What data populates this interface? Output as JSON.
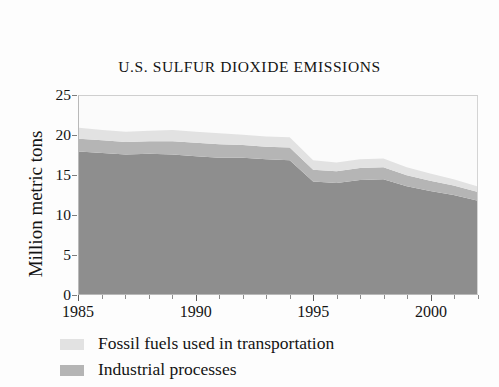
{
  "figure": {
    "title": "U.S. SULFUR DIOXIDE EMISSIONS"
  },
  "colors": {
    "band_electric": "#8e8e8e",
    "band_industrial": "#b5b5b5",
    "band_transport": "#e2e2e2",
    "plot_background": "#fbfbfb",
    "frame": "#b9b9b9",
    "text": "#141414"
  },
  "legend": {
    "position": "below-axis",
    "items": [
      {
        "label": "Fossil fuels used in transportation",
        "color": "#e2e2e2",
        "swatch": "light-gray-swatch"
      },
      {
        "label": "Industrial processes",
        "color": "#b5b5b5",
        "swatch": "medium-gray-swatch"
      }
    ]
  },
  "chart_data": {
    "type": "area",
    "stacked": true,
    "title": "U.S. SULFUR DIOXIDE EMISSIONS",
    "xlabel": "",
    "ylabel": "Million metric tons",
    "xlim": [
      1985,
      2002
    ],
    "ylim": [
      0,
      25
    ],
    "yticks": [
      0,
      5,
      10,
      15,
      20,
      25
    ],
    "ytick_labels": [
      "0",
      "5",
      "10",
      "15",
      "20",
      "25"
    ],
    "xticks": [
      1985,
      1990,
      1995,
      2000
    ],
    "xtick_labels": [
      "1985",
      "1990",
      "1995",
      "2000"
    ],
    "x_minor_ticks": [
      1986,
      1987,
      1988,
      1989,
      1991,
      1992,
      1993,
      1994,
      1996,
      1997,
      1998,
      1999,
      2001,
      2002
    ],
    "grid": false,
    "legend_position": "below",
    "x": [
      1985,
      1986,
      1987,
      1988,
      1989,
      1990,
      1991,
      1992,
      1993,
      1994,
      1995,
      1996,
      1997,
      1998,
      1999,
      2000,
      2001,
      2002
    ],
    "series": [
      {
        "name": "Electric utilities and other",
        "color": "#8e8e8e",
        "values": [
          18.0,
          17.8,
          17.6,
          17.7,
          17.6,
          17.4,
          17.2,
          17.2,
          17.0,
          16.9,
          14.2,
          14.0,
          14.4,
          14.5,
          13.6,
          13.0,
          12.5,
          11.8
        ]
      },
      {
        "name": "Industrial processes",
        "color": "#b5b5b5",
        "values": [
          1.6,
          1.6,
          1.6,
          1.6,
          1.7,
          1.7,
          1.7,
          1.6,
          1.6,
          1.6,
          1.5,
          1.5,
          1.5,
          1.5,
          1.4,
          1.3,
          1.2,
          1.1
        ]
      },
      {
        "name": "Fossil fuels used in transportation",
        "color": "#e2e2e2",
        "values": [
          1.4,
          1.3,
          1.3,
          1.3,
          1.4,
          1.4,
          1.4,
          1.3,
          1.3,
          1.3,
          1.2,
          1.1,
          1.1,
          1.1,
          1.0,
          0.9,
          0.8,
          0.7
        ]
      }
    ],
    "totals": [
      21.0,
      20.7,
      20.5,
      20.6,
      20.7,
      20.5,
      20.3,
      20.1,
      19.9,
      19.8,
      16.9,
      16.6,
      17.0,
      17.1,
      16.0,
      15.2,
      14.5,
      13.6
    ]
  }
}
